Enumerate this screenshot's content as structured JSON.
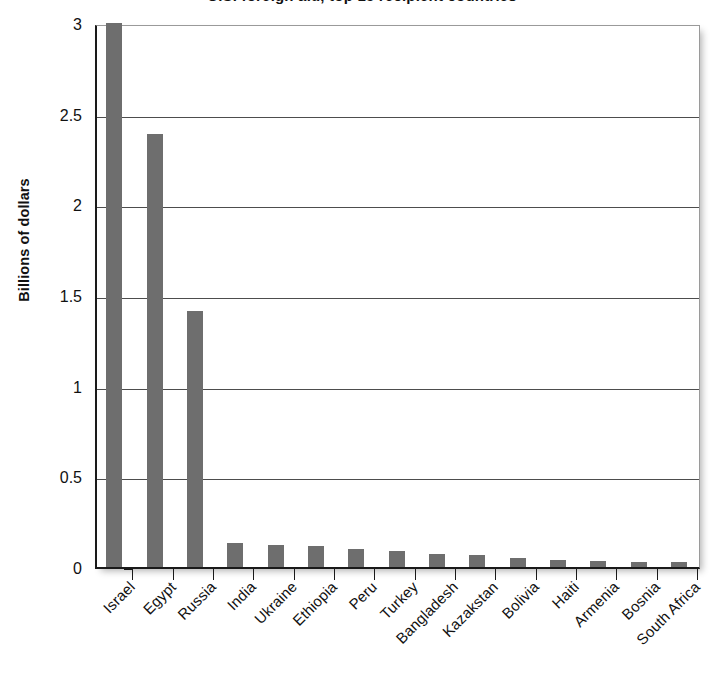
{
  "chart_data": {
    "type": "bar",
    "title": "U.S. foreign aid, top 15 recipient countries",
    "xlabel": "",
    "ylabel": "Billions of dollars",
    "ylim": [
      0,
      3
    ],
    "yticks": [
      0,
      0.5,
      1,
      1.5,
      2,
      2.5,
      3
    ],
    "ytick_labels": [
      "0",
      "0.5",
      "1",
      "1.5",
      "2",
      "2.5",
      "3"
    ],
    "grid": "horizontal",
    "legend": "none",
    "bar_color": "#6e6e6e",
    "categories": [
      "Israel",
      "Egypt",
      "Russia",
      "India",
      "Ukraine",
      "Ethiopia",
      "Peru",
      "Turkey",
      "Bangladesh",
      "Kazakstan",
      "Bolivia",
      "Haiti",
      "Armenia",
      "Bosnia",
      "South Africa"
    ],
    "values": [
      3.0,
      2.39,
      1.41,
      0.13,
      0.12,
      0.115,
      0.1,
      0.09,
      0.07,
      0.065,
      0.05,
      0.04,
      0.035,
      0.03,
      0.03
    ]
  },
  "axes": {
    "y_title": "Billions of dollars"
  }
}
